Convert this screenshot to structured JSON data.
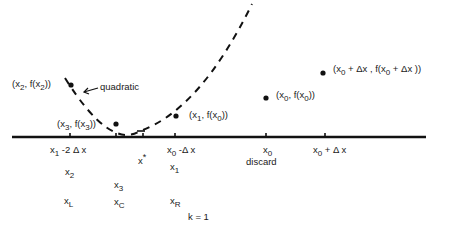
{
  "diagram": {
    "curve_label": "quadratic",
    "points": [
      {
        "id": "p_x2",
        "label_pre": "(x",
        "label_sub": "2",
        "label_mid": ", f(x",
        "label_sub2": "2",
        "label_post": "))"
      },
      {
        "id": "p_x3",
        "label_pre": "(x",
        "label_sub": "3",
        "label_mid": ", f(x",
        "label_sub2": "3",
        "label_post": "))"
      },
      {
        "id": "p_x1",
        "label_pre": "(x",
        "label_sub": "1",
        "label_mid": ", f(x",
        "label_sub2": "0",
        "label_post": "))"
      },
      {
        "id": "p_x0",
        "label_pre": "(x",
        "label_sub": "0",
        "label_mid": ", f(x",
        "label_sub2": "0",
        "label_post": "))"
      },
      {
        "id": "p_x0dx",
        "label_pre": "(x",
        "label_sub": "0",
        "label_mid": " + Δx , f(x",
        "label_sub2": "0",
        "label_post": " + Δx ))"
      }
    ],
    "axis_ticks": [
      {
        "pre": "x",
        "sub": "1",
        "post": " -2 Δ x"
      },
      {
        "pre": "x",
        "sup": "*"
      },
      {
        "pre": "x",
        "sub": "0",
        "post": " -Δ x"
      },
      {
        "pre": "x",
        "sub": "0",
        "note": "discard"
      },
      {
        "pre": "x",
        "sub": "0",
        "post": " + Δ x"
      }
    ],
    "rows": {
      "row1": [
        {
          "pre": "x",
          "sub": "2"
        },
        {
          "pre": "x",
          "sub": "1"
        }
      ],
      "row2": [
        {
          "pre": "x",
          "sub": "3"
        }
      ],
      "row3": [
        {
          "pre": "x",
          "sub": "L"
        },
        {
          "pre": "x",
          "sub": "C"
        },
        {
          "pre": "x",
          "sub": "R"
        }
      ]
    },
    "iteration_label": "k = 1"
  }
}
